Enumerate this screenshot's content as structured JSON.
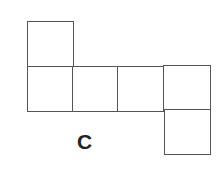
{
  "diagram": {
    "type": "cube-net",
    "label": "C",
    "stroke_color": "#555555",
    "squares": [
      {
        "id": "top-flap",
        "row": 0,
        "col": 0
      },
      {
        "id": "row-1",
        "row": 1,
        "col": 0
      },
      {
        "id": "row-2",
        "row": 1,
        "col": 1
      },
      {
        "id": "row-3",
        "row": 1,
        "col": 2
      },
      {
        "id": "row-4",
        "row": 1,
        "col": 3
      },
      {
        "id": "bottom-flap",
        "row": 2,
        "col": 3
      }
    ]
  }
}
